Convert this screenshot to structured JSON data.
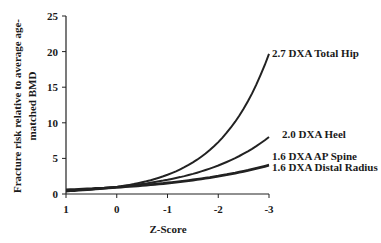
{
  "chart_data": {
    "type": "line",
    "title": "",
    "xlabel": "Z-Score",
    "ylabel_lines": [
      "Fracture risk relative to average age-",
      "matched BMD"
    ],
    "ylabel": "Fracture risk relative to average age-matched BMD",
    "x_ticks": [
      "1",
      "0",
      "-1",
      "-2",
      "-3"
    ],
    "y_ticks": [
      "0",
      "5",
      "10",
      "15",
      "20",
      "25"
    ],
    "xlim": [
      1,
      -3
    ],
    "ylim": [
      0,
      25
    ],
    "grid": false,
    "legend_position": "inline labels at right end of curves",
    "x": [
      1,
      0.5,
      0,
      -0.5,
      -1,
      -1.5,
      -2,
      -2.5,
      -3
    ],
    "series": [
      {
        "name": "2.7 DXA Total Hip",
        "values": [
          0.37,
          0.61,
          1.0,
          1.64,
          2.7,
          4.44,
          7.29,
          11.98,
          19.68
        ]
      },
      {
        "name": "2.0 DXA Heel",
        "values": [
          0.5,
          0.71,
          1.0,
          1.41,
          2.0,
          2.83,
          4.0,
          5.66,
          8.0
        ]
      },
      {
        "name": "1.6 DXA AP Spine",
        "values": [
          0.63,
          0.79,
          1.0,
          1.26,
          1.6,
          2.02,
          2.56,
          3.24,
          4.1
        ]
      },
      {
        "name": "1.6 DXA Distal Radius",
        "values": [
          0.63,
          0.79,
          1.0,
          1.26,
          1.6,
          2.02,
          2.56,
          3.24,
          4.1
        ]
      }
    ]
  }
}
